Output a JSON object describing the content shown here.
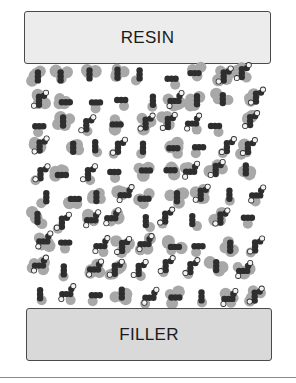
{
  "diagram": {
    "top_label": "RESIN",
    "bottom_label": "FILLER",
    "colors": {
      "resin_fill": "#ececec",
      "filler_fill": "#d9d9d9",
      "border": "#4a4a4a",
      "atom_light": "#a8a8a8",
      "atom_dark": "#2e2e2e",
      "atom_white": "#f2f2f2"
    },
    "network": {
      "description": "Interphase network of coupling-agent molecules linking resin (top) to filler (bottom)",
      "columns_x": [
        38,
        64,
        90,
        116,
        142,
        168,
        194,
        220,
        246
      ],
      "rows_y": [
        76,
        100,
        124,
        148,
        172,
        196,
        220,
        244,
        268,
        296
      ]
    }
  }
}
